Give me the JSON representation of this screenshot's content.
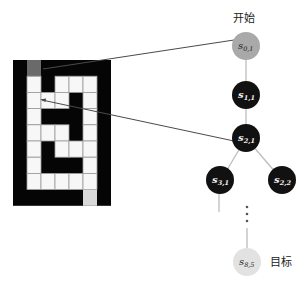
{
  "labels": {
    "start": "开始",
    "goal": "目标"
  },
  "grid": {
    "rows": 9,
    "cols": 7,
    "legend": {
      "B": "wall",
      "W": "free",
      "S": "start",
      "G": "goal"
    },
    "cells": [
      [
        "B",
        "S",
        "B",
        "B",
        "B",
        "B",
        "B"
      ],
      [
        "B",
        "W",
        "B",
        "W",
        "W",
        "W",
        "B"
      ],
      [
        "B",
        "W",
        "W",
        "W",
        "B",
        "W",
        "B"
      ],
      [
        "B",
        "W",
        "B",
        "B",
        "B",
        "W",
        "B"
      ],
      [
        "B",
        "W",
        "W",
        "W",
        "B",
        "W",
        "B"
      ],
      [
        "B",
        "W",
        "B",
        "W",
        "W",
        "W",
        "B"
      ],
      [
        "B",
        "W",
        "B",
        "B",
        "B",
        "W",
        "B"
      ],
      [
        "B",
        "W",
        "W",
        "W",
        "W",
        "W",
        "B"
      ],
      [
        "B",
        "B",
        "B",
        "B",
        "B",
        "G",
        "B"
      ]
    ]
  },
  "tree": {
    "nodes": [
      {
        "id": "s01",
        "base": "s",
        "sub": "0,1",
        "type": "start"
      },
      {
        "id": "s11",
        "base": "s",
        "sub": "1,1",
        "type": "dark"
      },
      {
        "id": "s21",
        "base": "s",
        "sub": "2,1",
        "type": "dark"
      },
      {
        "id": "s31",
        "base": "s",
        "sub": "3,1",
        "type": "dark"
      },
      {
        "id": "s22",
        "base": "s",
        "sub": "2,2",
        "type": "dark"
      },
      {
        "id": "s85",
        "base": "s",
        "sub": "8,5",
        "type": "goal"
      }
    ],
    "ellipsis": "⋮"
  },
  "colors": {
    "wall": "#050505",
    "start_cell": "#6a6a6a",
    "goal_cell": "#d8d8d8",
    "start_node": "#a9a9a9",
    "dark_node": "#111111",
    "goal_node": "#e2e2e2"
  }
}
